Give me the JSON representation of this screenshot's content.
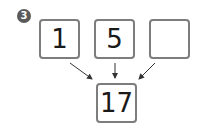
{
  "problem_number": "3",
  "inputs": [
    {
      "value": "1"
    },
    {
      "value": "5"
    },
    {
      "value": ""
    }
  ],
  "result": {
    "value": "17"
  },
  "colors": {
    "border": "#7d7d7d",
    "arrow": "#333333",
    "badge": "#5a5a5a"
  }
}
